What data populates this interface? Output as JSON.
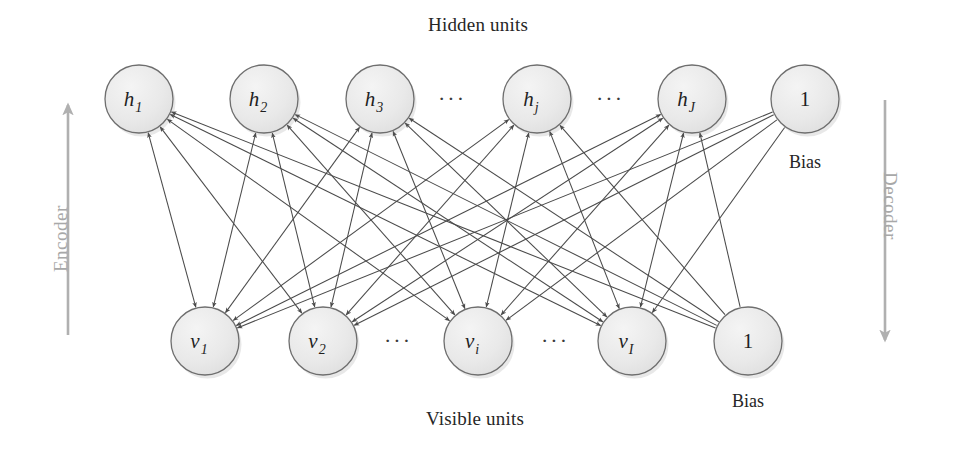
{
  "diagram": {
    "title_top": "Hidden units",
    "title_bottom": "Visible units",
    "flow_left_label": "Encoder",
    "flow_right_label": "Decoder",
    "bias_label_top": "Bias",
    "bias_label_bottom": "Bias",
    "node_fill": "#e9e9e9",
    "node_stroke": "#6e6e6e",
    "edge_color": "#4a4a4a",
    "flow_arrow_color": "#b0b0b0",
    "node_radius": 34
  },
  "hidden_layer": {
    "name": "hidden units",
    "nodes": [
      {
        "id": "h1",
        "base": "h",
        "sub": "1",
        "cx": 139,
        "cy": 99,
        "kind": "unit"
      },
      {
        "id": "h2",
        "base": "h",
        "sub": "2",
        "cx": 264,
        "cy": 99,
        "kind": "unit"
      },
      {
        "id": "h3",
        "base": "h",
        "sub": "3",
        "cx": 380,
        "cy": 99,
        "kind": "unit"
      },
      {
        "id": "hj",
        "base": "h",
        "sub": "j",
        "cx": 537,
        "cy": 99,
        "kind": "unit"
      },
      {
        "id": "hJ",
        "base": "h",
        "sub": "J",
        "cx": 692,
        "cy": 99,
        "kind": "unit"
      },
      {
        "id": "h_bias",
        "base": "1",
        "sub": "",
        "cx": 805,
        "cy": 99,
        "kind": "bias"
      }
    ],
    "ellipses": [
      {
        "cx": 452,
        "cy": 106,
        "text": "···"
      },
      {
        "cx": 610,
        "cy": 106,
        "text": "···"
      }
    ]
  },
  "visible_layer": {
    "name": "visible units",
    "nodes": [
      {
        "id": "v1",
        "base": "v",
        "sub": "1",
        "cx": 205,
        "cy": 341,
        "kind": "unit"
      },
      {
        "id": "v2",
        "base": "v",
        "sub": "2",
        "cx": 323,
        "cy": 341,
        "kind": "unit"
      },
      {
        "id": "vi",
        "base": "v",
        "sub": "i",
        "cx": 478,
        "cy": 341,
        "kind": "unit"
      },
      {
        "id": "vI",
        "base": "v",
        "sub": "I",
        "cx": 632,
        "cy": 341,
        "kind": "unit"
      },
      {
        "id": "v_bias",
        "base": "1",
        "sub": "",
        "cx": 748,
        "cy": 341,
        "kind": "bias"
      }
    ],
    "ellipses": [
      {
        "cx": 398,
        "cy": 348,
        "text": "···"
      },
      {
        "cx": 555,
        "cy": 348,
        "text": "···"
      }
    ]
  },
  "captions": {
    "top": {
      "x": 478,
      "y": 14
    },
    "bottom": {
      "x": 475,
      "y": 408
    },
    "bias_top": {
      "x": 805,
      "y": 152
    },
    "bias_bottom": {
      "x": 748,
      "y": 391
    }
  },
  "flow_arrows": [
    {
      "id": "encoder",
      "x": 68,
      "y1": 335,
      "y2": 105,
      "direction": "up",
      "label_x": 50,
      "label_y": 272
    },
    {
      "id": "decoder",
      "x": 885,
      "y1": 100,
      "y2": 340,
      "direction": "down",
      "label_x": 901,
      "label_y": 172
    }
  ],
  "edges": {
    "weights_bidirectional": true,
    "description": "every hidden unit connects to every visible unit with a double-headed arrow; each bias connects one-way to the opposite layer"
  }
}
